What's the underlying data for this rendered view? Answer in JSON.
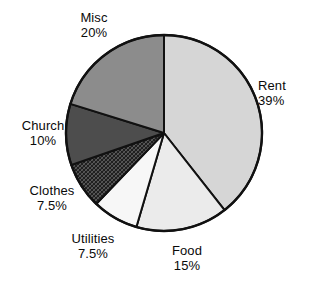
{
  "chart_data": {
    "type": "pie",
    "title": "",
    "subtitle": "",
    "xlabel": "",
    "ylabel": "",
    "legend_position": "none",
    "grid": false,
    "labels_outside": true,
    "start_angle_deg": 0,
    "direction": "clockwise",
    "categories": [
      "Rent",
      "Food",
      "Utilities",
      "Clothes",
      "Church",
      "Misc"
    ],
    "values": [
      39,
      15,
      7.5,
      7.5,
      10,
      20
    ],
    "value_unit": "%",
    "slices": [
      {
        "name": "Rent",
        "label": "Rent",
        "value": 39,
        "value_text": "39%",
        "fill": "#d6d6d6",
        "pattern": "solid",
        "label_position": "right"
      },
      {
        "name": "Food",
        "label": "Food",
        "value": 15,
        "value_text": "15%",
        "fill": "#ebebeb",
        "pattern": "solid",
        "label_position": "bottom"
      },
      {
        "name": "Utilities",
        "label": "Utilities",
        "value": 7.5,
        "value_text": "7.5%",
        "fill": "#f7f7f7",
        "pattern": "solid",
        "label_position": "bottom-left"
      },
      {
        "name": "Clothes",
        "label": "Clothes",
        "value": 7.5,
        "value_text": "7.5%",
        "fill": "#2b2b2b",
        "pattern": "crosshatch",
        "label_position": "left-lower"
      },
      {
        "name": "Church",
        "label": "Church",
        "value": 10,
        "value_text": "10%",
        "fill": "#4d4d4d",
        "pattern": "solid",
        "label_position": "left"
      },
      {
        "name": "Misc",
        "label": "Misc",
        "value": 20,
        "value_text": "20%",
        "fill": "#8c8c8c",
        "pattern": "solid",
        "label_position": "top-left"
      }
    ]
  },
  "colors": {
    "outline": "#111111",
    "background": "#ffffff",
    "text": "#0a0a0a"
  }
}
